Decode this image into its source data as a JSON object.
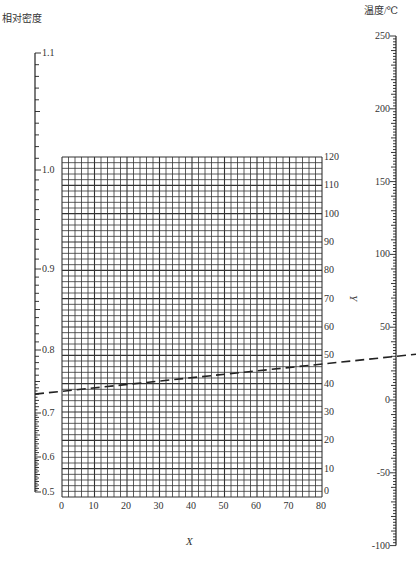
{
  "chart_data": {
    "type": "nomograph",
    "title": "",
    "left_axis": {
      "label": "相对密度",
      "ticks": [
        1.1,
        1.0,
        0.9,
        0.8,
        0.7,
        0.6,
        0.5
      ],
      "tick_labels": [
        "1.1",
        "1.0",
        "0.9",
        "0.8",
        "0.7",
        "0.6",
        "0.5"
      ]
    },
    "right_axis": {
      "label": "温度/℃",
      "ticks": [
        250,
        200,
        150,
        100,
        50,
        0,
        -50,
        -100
      ],
      "tick_labels": [
        "250",
        "200",
        "150",
        "100",
        "50",
        "0",
        "-50",
        "-100"
      ]
    },
    "grid": {
      "xlabel": "X",
      "ylabel": "Y",
      "xlim": [
        0,
        80
      ],
      "ylim": [
        0,
        120
      ],
      "x_ticks": [
        0,
        10,
        20,
        30,
        40,
        50,
        60,
        70,
        80
      ],
      "y_ticks": [
        0,
        10,
        20,
        30,
        40,
        50,
        60,
        70,
        80,
        90,
        100,
        110,
        120
      ],
      "cell_size": 2
    },
    "dashed_line": {
      "from": {
        "axis": "relative_density",
        "value": 0.73
      },
      "to": {
        "axis": "temperature",
        "value": 30
      },
      "grid_y_at_x0": 35,
      "grid_y_at_x80": 46
    }
  },
  "labels": {
    "left_title": "相对密度",
    "right_title": "温度/℃",
    "x_title": "X",
    "y_title": "Y"
  }
}
